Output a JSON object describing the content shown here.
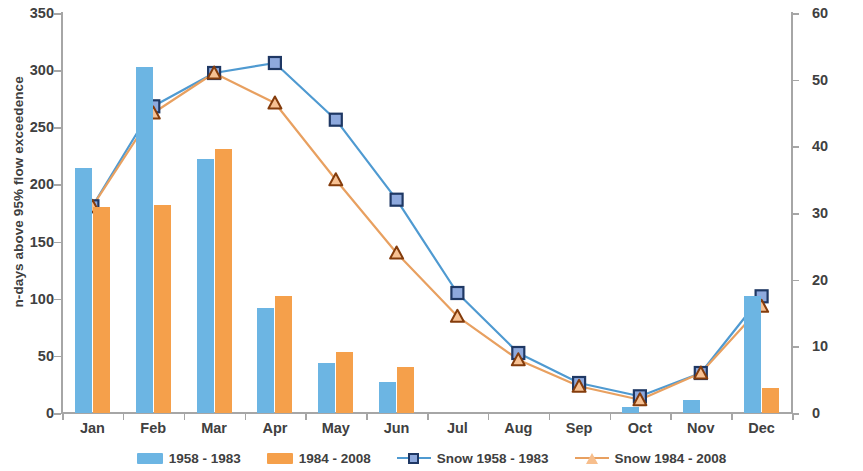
{
  "axes": {
    "y_left_title": "n-days above 95% flow exceedence",
    "y_right_title": "Average snow (water equivalent, mm)",
    "y_left_ticks": [
      "0",
      "50",
      "100",
      "150",
      "200",
      "250",
      "300",
      "350"
    ],
    "y_right_ticks": [
      "0",
      "10",
      "20",
      "30",
      "40",
      "50",
      "60"
    ]
  },
  "legend": {
    "items": [
      {
        "label": "1958 - 1983",
        "type": "bar",
        "color": "#6cb5e3"
      },
      {
        "label": "1984 - 2008",
        "type": "bar",
        "color": "#f5a04b"
      },
      {
        "label": "Snow 1958 - 1983",
        "type": "line-square",
        "color": "#4f9ad1"
      },
      {
        "label": "Snow 1984 - 2008",
        "type": "line-triangle",
        "color": "#e8a060"
      }
    ]
  },
  "chart_data": {
    "type": "bar",
    "title": "",
    "xlabel": "",
    "ylabel": "n-days above 95% flow exceedence",
    "y2label": "Average snow (water equivalent, mm)",
    "categories": [
      "Jan",
      "Feb",
      "Mar",
      "Apr",
      "May",
      "Jun",
      "Jul",
      "Aug",
      "Sep",
      "Oct",
      "Nov",
      "Dec"
    ],
    "ylim": [
      0,
      350
    ],
    "y2lim": [
      0,
      60
    ],
    "grid": false,
    "legend_position": "bottom",
    "series": [
      {
        "name": "1958 - 1983",
        "kind": "bar",
        "axis": "left",
        "color": "#6cb5e3",
        "values": [
          214,
          303,
          222,
          92,
          44,
          27,
          0,
          0,
          0,
          5,
          11,
          102
        ]
      },
      {
        "name": "1984 - 2008",
        "kind": "bar",
        "axis": "left",
        "color": "#f5a04b",
        "values": [
          180,
          182,
          231,
          102,
          53,
          40,
          0,
          0,
          0,
          0,
          0,
          22
        ]
      },
      {
        "name": "Snow 1958 - 1983",
        "kind": "line",
        "marker": "square",
        "axis": "right",
        "color": "#4f9ad1",
        "values": [
          31,
          46,
          51,
          52.5,
          44,
          32,
          18,
          9,
          4.5,
          2.5,
          6,
          17.5
        ]
      },
      {
        "name": "Snow 1984 - 2008",
        "kind": "line",
        "marker": "triangle",
        "axis": "right",
        "color": "#e8a060",
        "values": [
          31,
          45,
          51,
          46.5,
          35,
          24,
          14.5,
          8,
          4,
          2,
          6,
          16
        ]
      }
    ]
  }
}
